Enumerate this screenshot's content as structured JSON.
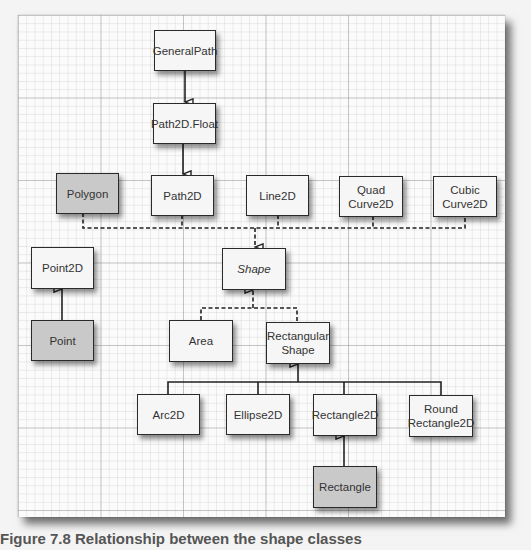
{
  "diagram": {
    "type": "class-hierarchy",
    "colors": {
      "paper": "#fbfbfb",
      "grid_major": "#969696",
      "grid_minor": "#aaaaaa",
      "box_fill": "#f6f6f6",
      "box_fill_highlighted": "#c9c9c9",
      "box_border": "#2a2a2a"
    },
    "nodes": [
      {
        "id": "GeneralPath",
        "label": "GeneralPath",
        "shaded": false,
        "italic": false
      },
      {
        "id": "Path2DFloat",
        "label": "Path2D.Float",
        "shaded": false,
        "italic": false
      },
      {
        "id": "Polygon",
        "label": "Polygon",
        "shaded": true,
        "italic": false
      },
      {
        "id": "Path2D",
        "label": "Path2D",
        "shaded": false,
        "italic": false
      },
      {
        "id": "Line2D",
        "label": "Line2D",
        "shaded": false,
        "italic": false
      },
      {
        "id": "QuadCurve2D",
        "label": "Quad Curve2D",
        "line1": "Quad",
        "line2": "Curve2D",
        "shaded": false,
        "italic": false
      },
      {
        "id": "CubicCurve2D",
        "label": "Cubic Curve2D",
        "line1": "Cubic",
        "line2": "Curve2D",
        "shaded": false,
        "italic": false
      },
      {
        "id": "Point2D",
        "label": "Point2D",
        "shaded": false,
        "italic": false
      },
      {
        "id": "Shape",
        "label": "Shape",
        "shaded": false,
        "italic": true
      },
      {
        "id": "Point",
        "label": "Point",
        "shaded": true,
        "italic": false
      },
      {
        "id": "Area",
        "label": "Area",
        "shaded": false,
        "italic": false
      },
      {
        "id": "RectangularShape",
        "label": "Rectangular Shape",
        "line1": "Rectangular",
        "line2": "Shape",
        "shaded": false,
        "italic": false
      },
      {
        "id": "Arc2D",
        "label": "Arc2D",
        "shaded": false,
        "italic": false
      },
      {
        "id": "Ellipse2D",
        "label": "Ellipse2D",
        "shaded": false,
        "italic": false
      },
      {
        "id": "Rectangle2D",
        "label": "Rectangle2D",
        "shaded": false,
        "italic": false
      },
      {
        "id": "RoundRectangle2D",
        "label": "Round Rectangle2D",
        "line1": "Round",
        "line2": "Rectangle2D",
        "shaded": false,
        "italic": false
      },
      {
        "id": "Rectangle",
        "label": "Rectangle",
        "shaded": true,
        "italic": false
      }
    ],
    "edges": [
      {
        "from": "GeneralPath",
        "to": "Path2DFloat",
        "style": "solid",
        "relation": "extends"
      },
      {
        "from": "Path2DFloat",
        "to": "Path2D",
        "style": "solid",
        "relation": "extends"
      },
      {
        "from": "Polygon",
        "to": "Shape",
        "style": "dashed",
        "relation": "implements"
      },
      {
        "from": "Path2D",
        "to": "Shape",
        "style": "dashed",
        "relation": "implements"
      },
      {
        "from": "Line2D",
        "to": "Shape",
        "style": "dashed",
        "relation": "implements"
      },
      {
        "from": "QuadCurve2D",
        "to": "Shape",
        "style": "dashed",
        "relation": "implements"
      },
      {
        "from": "CubicCurve2D",
        "to": "Shape",
        "style": "dashed",
        "relation": "implements"
      },
      {
        "from": "Point",
        "to": "Point2D",
        "style": "solid",
        "relation": "extends"
      },
      {
        "from": "Area",
        "to": "Shape",
        "style": "dashed",
        "relation": "implements"
      },
      {
        "from": "RectangularShape",
        "to": "Shape",
        "style": "dashed",
        "relation": "implements"
      },
      {
        "from": "Arc2D",
        "to": "RectangularShape",
        "style": "solid",
        "relation": "extends"
      },
      {
        "from": "Ellipse2D",
        "to": "RectangularShape",
        "style": "solid",
        "relation": "extends"
      },
      {
        "from": "Rectangle2D",
        "to": "RectangularShape",
        "style": "solid",
        "relation": "extends"
      },
      {
        "from": "RoundRectangle2D",
        "to": "RectangularShape",
        "style": "solid",
        "relation": "extends"
      },
      {
        "from": "Rectangle",
        "to": "Rectangle2D",
        "style": "solid",
        "relation": "extends"
      }
    ]
  },
  "caption": {
    "text": "Figure 7.8 Relationship between the shape classes"
  }
}
